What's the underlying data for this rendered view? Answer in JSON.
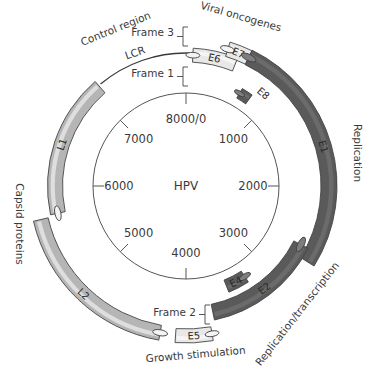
{
  "center_label": "HPV",
  "genome": {
    "length_bp": 8000,
    "center": [
      186,
      186
    ],
    "ruler_radius": 93,
    "ticks": [
      {
        "bp": 0,
        "label": "8000/0"
      },
      {
        "bp": 1000,
        "label": "1000"
      },
      {
        "bp": 2000,
        "label": "2000"
      },
      {
        "bp": 3000,
        "label": "3000"
      },
      {
        "bp": 4000,
        "label": "4000"
      },
      {
        "bp": 5000,
        "label": "5000"
      },
      {
        "bp": 6000,
        "label": "6000"
      },
      {
        "bp": 7000,
        "label": "7000"
      }
    ]
  },
  "colors": {
    "light_gene": "#e8e8e8",
    "medium_gene": "#b5b5b5",
    "dark_gene": "#5a5a5a",
    "outline": "#444444",
    "text": "#3a3a3a",
    "ruler": "#555555"
  },
  "genes": [
    {
      "name": "E6",
      "start_deg": 3,
      "end_deg": 22,
      "radius": 131,
      "width": 14,
      "shade": "light",
      "frame": "Frame 3"
    },
    {
      "name": "E7",
      "start_deg": 17,
      "end_deg": 26,
      "radius": 143,
      "width": 15,
      "shade": "light",
      "frame": "Frame 1"
    },
    {
      "name": "E1",
      "start_deg": 26,
      "end_deg": 122,
      "radius": 143,
      "width": 16,
      "shade": "dark",
      "frame": "Frame 1"
    },
    {
      "name": "E8",
      "start_deg": 30,
      "end_deg": 36,
      "radius": 107,
      "width": 11,
      "shade": "dark",
      "frame": ""
    },
    {
      "name": "E2",
      "start_deg": 117,
      "end_deg": 168,
      "radius": 129,
      "width": 16,
      "shade": "dark",
      "frame": "Frame 2"
    },
    {
      "name": "E4",
      "start_deg": 147,
      "end_deg": 158,
      "radius": 108,
      "width": 13,
      "shade": "dark",
      "frame": ""
    },
    {
      "name": "E5",
      "start_deg": 170,
      "end_deg": 184,
      "radius": 150,
      "width": 14,
      "shade": "light",
      "frame": "Frame 2"
    },
    {
      "name": "L2",
      "start_deg": 190,
      "end_deg": 257,
      "radius": 149,
      "width": 15,
      "shade": "medium",
      "frame": ""
    },
    {
      "name": "L1",
      "start_deg": 258,
      "end_deg": 319,
      "radius": 131,
      "width": 15,
      "shade": "medium",
      "frame": ""
    }
  ],
  "lcr": {
    "label": "LCR",
    "start_deg": 320,
    "end_deg": 362,
    "radius": 133
  },
  "frames": [
    {
      "label": "Frame 3",
      "x": 174,
      "y": 36,
      "bracket_top": 27,
      "bracket_bottom": 46
    },
    {
      "label": "Frame 1",
      "x": 174,
      "y": 77,
      "bracket_top": 67,
      "bracket_bottom": 86
    },
    {
      "label": "Frame 2",
      "x": 196,
      "y": 316,
      "bracket_top": 305,
      "bracket_bottom": 324
    }
  ],
  "region_labels": [
    {
      "text": "Control region",
      "x": 117,
      "y": 32,
      "rotate": -22
    },
    {
      "text": "Viral oncogenes",
      "x": 240,
      "y": 20,
      "rotate": 16
    },
    {
      "text": "Replication",
      "x": 354,
      "y": 153,
      "rotate": 90
    },
    {
      "text": "Replication/transcription",
      "x": 300,
      "y": 316,
      "rotate": -52
    },
    {
      "text": "Capsid proteins",
      "x": 16,
      "y": 224,
      "rotate": 90
    },
    {
      "text": "Growth stimulation",
      "x": 196,
      "y": 358,
      "rotate": -5
    }
  ]
}
